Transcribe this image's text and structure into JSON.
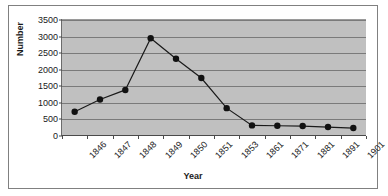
{
  "chart_data": {
    "type": "line",
    "title": "",
    "xlabel": "Year",
    "ylabel": "Number",
    "categories": [
      "1846",
      "1847",
      "1848",
      "1849",
      "1850",
      "1851",
      "1853",
      "1861",
      "1871",
      "1881",
      "1891",
      "1901"
    ],
    "values": [
      730,
      1100,
      1390,
      2950,
      2330,
      1750,
      840,
      320,
      310,
      300,
      270,
      240
    ],
    "series": [
      {
        "name": "Number",
        "values": [
          730,
          1100,
          1390,
          2950,
          2330,
          1750,
          840,
          320,
          310,
          300,
          270,
          240
        ]
      }
    ],
    "ylim": [
      0,
      3500
    ],
    "yticks": [
      0,
      500,
      1000,
      1500,
      2000,
      2500,
      3000,
      3500
    ],
    "ytick_labels": [
      "0",
      "500",
      "1000",
      "1500",
      "2000",
      "2500",
      "3000",
      "3500"
    ],
    "grid": true,
    "legend": false,
    "legend_position": "none",
    "marker": "filled-circle",
    "colors": {
      "plot_background": "#c0c0c0",
      "gridline": "#7a7a7a",
      "series_line": "#1a1a1a",
      "marker": "#111111",
      "axis": "#4a4a4a",
      "frame_border": "#808080",
      "text": "#1a1a1a",
      "page_background": "#ffffff"
    },
    "xtick_rotation": -45
  }
}
